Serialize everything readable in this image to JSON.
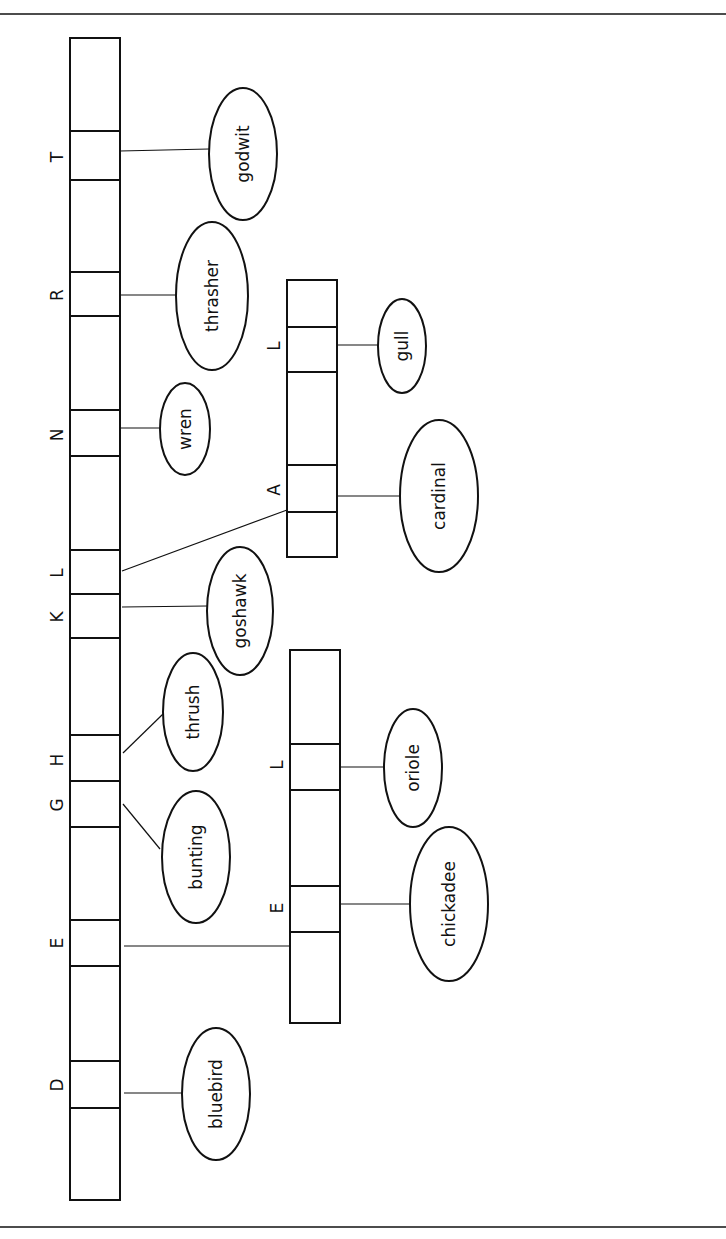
{
  "diagram": {
    "orientation": "rotated-90-ccw",
    "rules": {
      "top_y": 14,
      "bottom_y": 1227
    },
    "main_array": {
      "x": 70,
      "width": 50,
      "y_top": 38,
      "y_bottom": 1200,
      "dividers": [
        131,
        180,
        272,
        316,
        410,
        456,
        550,
        594,
        638,
        735,
        781,
        827,
        920,
        966,
        1061,
        1108
      ],
      "slots": [
        {
          "label": "T",
          "label_y": 157,
          "bird": "godwit"
        },
        {
          "label": "R",
          "label_y": 295,
          "bird": "thrasher"
        },
        {
          "label": "N",
          "label_y": 435,
          "bird": "wren"
        },
        {
          "label": "L",
          "label_y": 573,
          "bird": null,
          "points_to": "upper_subarray"
        },
        {
          "label": "K",
          "label_y": 617,
          "bird": "goshawk"
        },
        {
          "label": "H",
          "label_y": 760,
          "bird": "thrush"
        },
        {
          "label": "G",
          "label_y": 805,
          "bird": "bunting"
        },
        {
          "label": "E",
          "label_y": 943,
          "bird": null,
          "points_to": "lower_subarray"
        },
        {
          "label": "D",
          "label_y": 1085,
          "bird": "bluebird"
        }
      ]
    },
    "upper_subarray": {
      "x": 287,
      "width": 50,
      "y_top": 280,
      "y_bottom": 557,
      "dividers": [
        327,
        372,
        465,
        512
      ],
      "slots": [
        {
          "label": "L",
          "label_y": 346,
          "bird": "gull"
        },
        {
          "label": "A",
          "label_y": 490,
          "bird": "cardinal"
        }
      ]
    },
    "lower_subarray": {
      "x": 290,
      "width": 50,
      "y_top": 650,
      "y_bottom": 1023,
      "dividers": [
        744,
        790,
        886,
        932
      ],
      "slots": [
        {
          "label": "L",
          "label_y": 765,
          "bird": "oriole"
        },
        {
          "label": "E",
          "label_y": 908,
          "bird": "chickadee"
        }
      ]
    },
    "birds": {
      "godwit": {
        "text": "godwit",
        "cx": 243,
        "cy": 154,
        "rx": 34,
        "ry": 66
      },
      "thrasher": {
        "text": "thrasher",
        "cx": 212,
        "cy": 296,
        "rx": 36,
        "ry": 74
      },
      "wren": {
        "text": "wren",
        "cx": 185,
        "cy": 429,
        "rx": 25,
        "ry": 46
      },
      "goshawk": {
        "text": "goshawk",
        "cx": 240,
        "cy": 611,
        "rx": 33,
        "ry": 64
      },
      "thrush": {
        "text": "thrush",
        "cx": 193,
        "cy": 712,
        "rx": 30,
        "ry": 59
      },
      "bunting": {
        "text": "bunting",
        "cx": 196,
        "cy": 857,
        "rx": 34,
        "ry": 66
      },
      "bluebird": {
        "text": "bluebird",
        "cx": 216,
        "cy": 1094,
        "rx": 34,
        "ry": 66
      },
      "gull": {
        "text": "gull",
        "cx": 402,
        "cy": 346,
        "rx": 24,
        "ry": 47
      },
      "cardinal": {
        "text": "cardinal",
        "cx": 439,
        "cy": 496,
        "rx": 39,
        "ry": 76
      },
      "oriole": {
        "text": "oriole",
        "cx": 413,
        "cy": 768,
        "rx": 29,
        "ry": 59
      },
      "chickadee": {
        "text": "chickadee",
        "cx": 449,
        "cy": 904,
        "rx": 39,
        "ry": 77
      }
    },
    "connectors": [
      {
        "from": "T",
        "x1": 120,
        "y1": 151,
        "x2": 209,
        "y2": 149
      },
      {
        "from": "R",
        "x1": 121,
        "y1": 295,
        "x2": 176,
        "y2": 295
      },
      {
        "from": "N",
        "x1": 121,
        "y1": 428,
        "x2": 160,
        "y2": 428
      },
      {
        "from": "L->upper",
        "x1": 122,
        "y1": 571,
        "x2": 287,
        "y2": 510
      },
      {
        "from": "K",
        "x1": 122,
        "y1": 607,
        "x2": 207,
        "y2": 606
      },
      {
        "from": "H",
        "x1": 123,
        "y1": 753,
        "x2": 163,
        "y2": 714
      },
      {
        "from": "G",
        "x1": 123,
        "y1": 804,
        "x2": 160,
        "y2": 849
      },
      {
        "from": "E->lower",
        "x1": 124,
        "y1": 946,
        "x2": 290,
        "y2": 946
      },
      {
        "from": "D",
        "x1": 124,
        "y1": 1093,
        "x2": 182,
        "y2": 1093
      },
      {
        "from": "upper.L",
        "x1": 337,
        "y1": 345,
        "x2": 378,
        "y2": 345
      },
      {
        "from": "upper.A",
        "x1": 338,
        "y1": 496,
        "x2": 400,
        "y2": 496
      },
      {
        "from": "lower.L",
        "x1": 340,
        "y1": 767,
        "x2": 384,
        "y2": 767
      },
      {
        "from": "lower.E",
        "x1": 341,
        "y1": 904,
        "x2": 410,
        "y2": 904
      }
    ]
  }
}
